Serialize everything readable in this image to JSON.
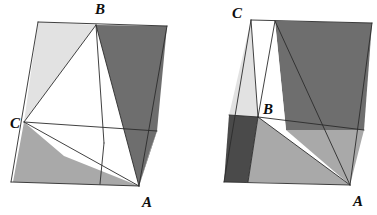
{
  "figure": {
    "type": "geometry-diagram",
    "canvas": {
      "width": 377,
      "height": 215,
      "background": "#ffffff"
    },
    "palette": {
      "white": "#ffffff",
      "light_gray": "#e2e2e2",
      "medium_gray": "#a9a9a9",
      "dark_gray": "#6e6e6e",
      "darkest_gray": "#4a4a4a",
      "stroke": "#2b2b2b",
      "label_color": "#0d0d0d"
    },
    "stroke_width": 0.9,
    "panels": [
      {
        "name": "left-panel",
        "outline": [
          [
            38,
            22
          ],
          [
            167,
            26
          ],
          [
            143,
            186
          ],
          [
            11,
            182
          ]
        ],
        "labels": [
          {
            "name": "vertex-label-b",
            "text": "B",
            "x": 95,
            "y": 14
          },
          {
            "name": "vertex-label-c",
            "text": "C",
            "x": 10,
            "y": 128
          },
          {
            "name": "vertex-label-a",
            "text": "A",
            "x": 142,
            "y": 207
          }
        ],
        "regions": [
          {
            "name": "region-upper-left-light",
            "fill": "#e2e2e2",
            "points": [
              [
                38,
                22
              ],
              [
                96,
                25
              ],
              [
                24,
                122
              ]
            ]
          },
          {
            "name": "region-upper-right-dark",
            "fill": "#6e6e6e",
            "points": [
              [
                96,
                25
              ],
              [
                167,
                26
              ],
              [
                157,
                131
              ],
              [
                139,
                186
              ]
            ]
          },
          {
            "name": "region-center-white-upper",
            "fill": "#ffffff",
            "points": [
              [
                24,
                122
              ],
              [
                96,
                25
              ],
              [
                104,
                143
              ]
            ]
          },
          {
            "name": "region-center-white-lower",
            "fill": "#ffffff",
            "points": [
              [
                24,
                122
              ],
              [
                104,
                143
              ],
              [
                139,
                186
              ],
              [
                64,
                156
              ]
            ]
          },
          {
            "name": "region-lower-left-medium",
            "fill": "#a9a9a9",
            "points": [
              [
                24,
                122
              ],
              [
                64,
                156
              ],
              [
                139,
                186
              ],
              [
                13,
                182
              ]
            ]
          },
          {
            "name": "region-right-lower-medium",
            "fill": "#a9a9a9",
            "points": [
              [
                157,
                131
              ],
              [
                139,
                186
              ],
              [
                150,
                150
              ]
            ]
          }
        ],
        "strokes": [
          {
            "name": "edge-outline-top",
            "points": [
              [
                38,
                22
              ],
              [
                167,
                26
              ]
            ]
          },
          {
            "name": "edge-outline-right",
            "points": [
              [
                167,
                26
              ],
              [
                139,
                186
              ]
            ]
          },
          {
            "name": "edge-outline-bottom",
            "points": [
              [
                139,
                186
              ],
              [
                11,
                182
              ]
            ]
          },
          {
            "name": "edge-outline-left",
            "points": [
              [
                11,
                182
              ],
              [
                38,
                22
              ]
            ]
          },
          {
            "name": "segment-b-to-c",
            "points": [
              [
                96,
                25
              ],
              [
                24,
                122
              ]
            ]
          },
          {
            "name": "segment-c-horizontal",
            "points": [
              [
                24,
                122
              ],
              [
                157,
                131
              ]
            ]
          },
          {
            "name": "segment-b-down",
            "points": [
              [
                96,
                25
              ],
              [
                104,
                143
              ]
            ]
          },
          {
            "name": "segment-b-to-a",
            "points": [
              [
                96,
                25
              ],
              [
                139,
                186
              ]
            ]
          },
          {
            "name": "segment-c-to-a",
            "points": [
              [
                24,
                122
              ],
              [
                139,
                186
              ]
            ]
          },
          {
            "name": "segment-mid-vertical",
            "points": [
              [
                104,
                143
              ],
              [
                100,
                184
              ]
            ]
          }
        ]
      },
      {
        "name": "right-panel",
        "outline": [
          [
            251,
            20
          ],
          [
            372,
            23
          ],
          [
            350,
            185
          ],
          [
            224,
            182
          ]
        ],
        "labels": [
          {
            "name": "vertex-label-c",
            "text": "C",
            "x": 232,
            "y": 18
          },
          {
            "name": "vertex-label-b",
            "text": "B",
            "x": 263,
            "y": 114
          },
          {
            "name": "vertex-label-a",
            "text": "A",
            "x": 353,
            "y": 206
          }
        ],
        "regions": [
          {
            "name": "region-sliver-light",
            "fill": "#e2e2e2",
            "points": [
              [
                251,
                20
              ],
              [
                258,
                117
              ],
              [
                229,
                115
              ]
            ]
          },
          {
            "name": "region-top-white",
            "fill": "#ffffff",
            "points": [
              [
                251,
                20
              ],
              [
                275,
                21
              ],
              [
                258,
                117
              ]
            ]
          },
          {
            "name": "region-top-dark",
            "fill": "#6e6e6e",
            "points": [
              [
                275,
                21
              ],
              [
                372,
                23
              ],
              [
                364,
                130
              ],
              [
                286,
                130
              ]
            ]
          },
          {
            "name": "region-center-white",
            "fill": "#ffffff",
            "points": [
              [
                258,
                117
              ],
              [
                275,
                21
              ],
              [
                286,
                130
              ],
              [
                350,
                185
              ]
            ]
          },
          {
            "name": "region-left-darkest",
            "fill": "#4a4a4a",
            "points": [
              [
                229,
                115
              ],
              [
                258,
                117
              ],
              [
                248,
                182
              ],
              [
                224,
                182
              ]
            ]
          },
          {
            "name": "region-bottom-medium",
            "fill": "#a9a9a9",
            "points": [
              [
                258,
                117
              ],
              [
                350,
                185
              ],
              [
                248,
                182
              ]
            ]
          },
          {
            "name": "region-right-medium",
            "fill": "#a9a9a9",
            "points": [
              [
                286,
                130
              ],
              [
                364,
                130
              ],
              [
                350,
                185
              ]
            ]
          }
        ],
        "strokes": [
          {
            "name": "edge-outline-top",
            "points": [
              [
                251,
                20
              ],
              [
                372,
                23
              ]
            ]
          },
          {
            "name": "edge-outline-right",
            "points": [
              [
                372,
                23
              ],
              [
                350,
                185
              ]
            ]
          },
          {
            "name": "edge-outline-bottom",
            "points": [
              [
                350,
                185
              ],
              [
                224,
                182
              ]
            ]
          },
          {
            "name": "edge-outline-left",
            "points": [
              [
                224,
                182
              ],
              [
                251,
                20
              ]
            ]
          },
          {
            "name": "segment-c-to-b",
            "points": [
              [
                251,
                20
              ],
              [
                258,
                117
              ]
            ]
          },
          {
            "name": "segment-c-vertical-right",
            "points": [
              [
                275,
                21
              ],
              [
                258,
                117
              ]
            ]
          },
          {
            "name": "segment-b-horizontal",
            "points": [
              [
                258,
                117
              ],
              [
                364,
                130
              ]
            ]
          },
          {
            "name": "segment-c-to-a",
            "points": [
              [
                275,
                21
              ],
              [
                350,
                185
              ]
            ]
          },
          {
            "name": "segment-b-to-a",
            "points": [
              [
                258,
                117
              ],
              [
                350,
                185
              ]
            ]
          },
          {
            "name": "segment-b-down-left",
            "points": [
              [
                258,
                117
              ],
              [
                248,
                182
              ]
            ]
          },
          {
            "name": "segment-dark-left-top",
            "points": [
              [
                229,
                115
              ],
              [
                258,
                117
              ]
            ]
          }
        ]
      }
    ]
  }
}
